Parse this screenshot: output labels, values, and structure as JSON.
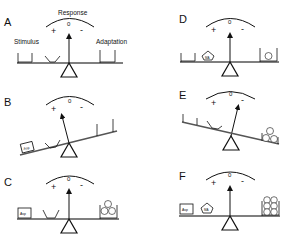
{
  "panels": [
    {
      "id": "A",
      "label": "A",
      "response_title": "Response",
      "stimulus_label": "Stimulus",
      "adaptation_label": "Adaptation",
      "plus": "+",
      "zero": "0",
      "minus": "-"
    },
    {
      "id": "B",
      "label": "B",
      "plus": "+",
      "zero": "0",
      "minus": "-",
      "box_left": "Asp"
    },
    {
      "id": "C",
      "label": "C",
      "plus": "+",
      "zero": "0",
      "minus": "-",
      "box_left": "Asp",
      "balls": [
        "Me",
        "Me",
        "Me"
      ]
    },
    {
      "id": "D",
      "label": "D",
      "plus": "+",
      "zero": "0",
      "minus": "-",
      "pentagon": "MA",
      "balls": [
        "Me"
      ]
    },
    {
      "id": "E",
      "label": "E",
      "plus": "+",
      "zero": "0",
      "minus": "-",
      "balls": [
        "Me",
        "Me",
        "Me"
      ]
    },
    {
      "id": "F",
      "label": "F",
      "plus": "+",
      "zero": "0",
      "minus": "-",
      "box_left": "Asp",
      "pentagon": "MA",
      "balls": [
        "Me",
        "Me",
        "Me",
        "Me",
        "Me",
        "Me"
      ]
    }
  ]
}
